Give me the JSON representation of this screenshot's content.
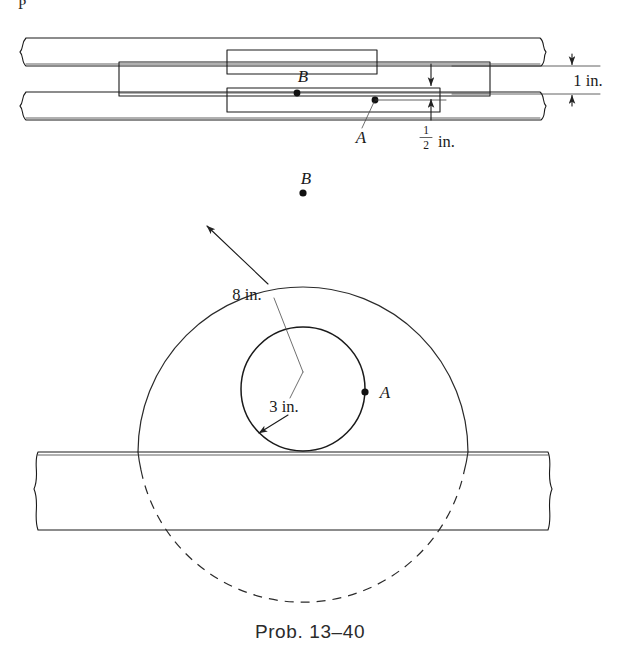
{
  "figure": {
    "caption": "Prob. 13–40",
    "page_fragment": "P",
    "top_view": {
      "point_labels": [
        {
          "name": "B",
          "text": "B"
        },
        {
          "name": "A",
          "text": "A"
        }
      ],
      "dimensions": [
        {
          "name": "overall-height",
          "text": "1 in.",
          "value": 1,
          "unit": "in."
        },
        {
          "name": "plate-thickness",
          "text": "½ in.",
          "numerator": "1",
          "denominator": "2",
          "suffix": "in.",
          "value": 0.5,
          "unit": "in."
        }
      ]
    },
    "front_view": {
      "point_labels": [
        {
          "name": "B",
          "text": "B"
        },
        {
          "name": "A",
          "text": "A"
        }
      ],
      "dimensions": [
        {
          "name": "outer-radius",
          "text": "8 in.",
          "value": 8,
          "unit": "in."
        },
        {
          "name": "inner-radius",
          "text": "3 in.",
          "value": 3,
          "unit": "in."
        }
      ]
    }
  },
  "colors": {
    "line": "#1a1a1a",
    "thin_line": "#3a3a3a",
    "leader": "#4a4a4a",
    "background": "#ffffff",
    "caption": "#2b2b2b"
  }
}
